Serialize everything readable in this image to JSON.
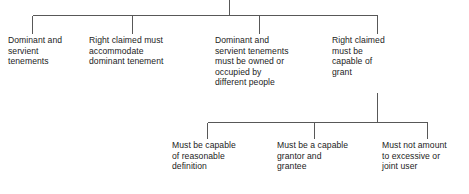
{
  "diagram": {
    "type": "tree-diagram",
    "orientation": "top-down",
    "line_color": "#585858",
    "text_color": "#1c1c1c",
    "background_color": "#ffffff",
    "root": {
      "label": "",
      "has_visible_box": false
    },
    "tier_one": [
      {
        "id": "dominant-servient-tenements",
        "text": "Dominant and\nservient\ntenements"
      },
      {
        "id": "accommodate-dominant",
        "text": "Right claimed must\naccommodate\ndominant tenement"
      },
      {
        "id": "owned-or-occupied",
        "text": "Dominant and\nservient tenements\nmust be owned or\noccupied by\ndifferent people"
      },
      {
        "id": "capable-of-grant",
        "text": "Right claimed\nmust be\ncapable of\ngrant"
      }
    ],
    "tier_two": [
      {
        "id": "reasonable-definition",
        "text": "Must be capable\nof reasonable\ndefinition"
      },
      {
        "id": "capable-grantor",
        "text": "Must be a capable\ngrantor and\ngrantee"
      },
      {
        "id": "not-excessive-user",
        "text": "Must not amount\nto excessive or\njoint user"
      }
    ]
  }
}
